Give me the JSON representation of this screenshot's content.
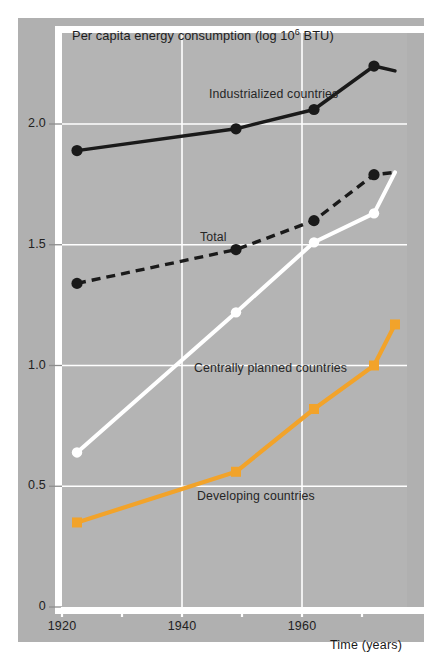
{
  "chart_data": {
    "type": "line",
    "title_main": "Per capita energy consumption (log 10",
    "title_sup": "6",
    "title_tail": " BTU)",
    "xlabel": "Time (years)",
    "ylabel": "",
    "xlim": [
      1920,
      1977.5
    ],
    "ylim": [
      0,
      2.42
    ],
    "grid": true,
    "legend_position": "inline-annotations",
    "x_ticks": [
      1920,
      1930,
      1940,
      1950,
      1960,
      1970
    ],
    "x_tick_labels": [
      "1920",
      "",
      "1940",
      "",
      "1960",
      ""
    ],
    "y_ticks": [
      0,
      0.5,
      1.0,
      1.5,
      2.0
    ],
    "y_tick_labels": [
      "0",
      "0.5",
      "1.0",
      "1.5",
      "2.0"
    ],
    "x": [
      1922.5,
      1949,
      1962,
      1972,
      1975.5
    ],
    "series": [
      {
        "name": "Industrialized countries",
        "style": "solid",
        "color": "#1a1a1a",
        "marker": "circle-filled-black",
        "values": [
          1.89,
          1.98,
          2.06,
          2.24,
          2.22
        ],
        "label_x": 1944.5,
        "label_y": 2.12
      },
      {
        "name": "Total",
        "style": "dashed",
        "color": "#1a1a1a",
        "marker": "circle-filled-black",
        "values": [
          1.34,
          1.48,
          1.6,
          1.79,
          1.8
        ],
        "label_x": 1943.0,
        "label_y": 1.53
      },
      {
        "name": "Centrally planned countries",
        "style": "solid",
        "color": "#ffffff",
        "marker": "circle-filled-white",
        "values": [
          0.64,
          1.22,
          1.51,
          1.63,
          1.8
        ],
        "label_x": 1942.0,
        "label_y": 0.985
      },
      {
        "name": "Developing countries",
        "style": "solid",
        "color": "#f2a32a",
        "marker": "square-filled-orange",
        "values": [
          0.35,
          0.56,
          0.82,
          1.0,
          1.17
        ],
        "label_x": 1942.5,
        "label_y": 0.455
      }
    ]
  },
  "colors": {
    "panel_background": "#b0b0b0",
    "plot_background": "#b4b4b4",
    "gridline": "#ffffff",
    "page_background": "#ffffff",
    "dark_series": "#1a1a1a",
    "white_series": "#ffffff",
    "orange_series": "#f2a32a",
    "text": "#222222"
  }
}
